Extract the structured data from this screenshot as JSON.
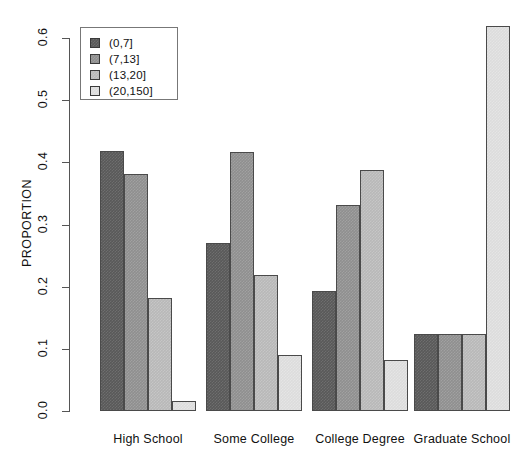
{
  "chart_data": {
    "type": "bar",
    "title": "",
    "subtitle": "",
    "xlabel": "",
    "ylabel": "PROPORTION",
    "ylim": [
      0.0,
      0.64
    ],
    "yticks": [
      "0.0",
      "0.1",
      "0.2",
      "0.3",
      "0.4",
      "0.5",
      "0.6"
    ],
    "ytick_values": [
      0.0,
      0.1,
      0.2,
      0.3,
      0.4,
      0.5,
      0.6
    ],
    "grid": false,
    "legend_position": "top-left",
    "grouped": true,
    "categories": [
      "High School",
      "Some College",
      "College Degree",
      "Graduate School"
    ],
    "series": [
      {
        "name": "(0,7]",
        "color": "#595959",
        "values": [
          0.418,
          0.271,
          0.193,
          0.124
        ]
      },
      {
        "name": "(7,13]",
        "color": "#8f8f8f",
        "values": [
          0.381,
          0.416,
          0.332,
          0.124
        ]
      },
      {
        "name": "(13,20]",
        "color": "#b8b8b8",
        "values": [
          0.181,
          0.218,
          0.387,
          0.124
        ]
      },
      {
        "name": "(20,150]",
        "color": "#dcdcdc",
        "values": [
          0.016,
          0.09,
          0.082,
          0.62
        ]
      }
    ]
  },
  "legend": {
    "items": [
      {
        "label": "(0,7]"
      },
      {
        "label": "(7,13]"
      },
      {
        "label": "(13,20]"
      },
      {
        "label": "(20,150]"
      }
    ]
  }
}
